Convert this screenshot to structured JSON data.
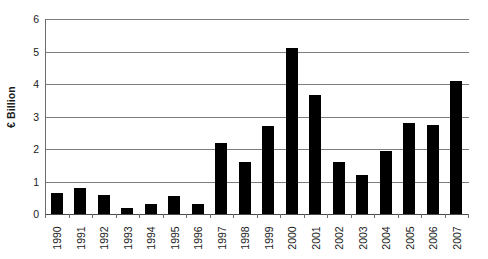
{
  "chart_data": {
    "type": "bar",
    "title": "",
    "xlabel": "",
    "ylabel": "€ Billion",
    "categories": [
      "1990",
      "1991",
      "1992",
      "1993",
      "1994",
      "1995",
      "1996",
      "1997",
      "1998",
      "1999",
      "2000",
      "2001",
      "2002",
      "2003",
      "2004",
      "2005",
      "2006",
      "2007"
    ],
    "values": [
      0.65,
      0.8,
      0.6,
      0.2,
      0.3,
      0.55,
      0.3,
      2.2,
      1.6,
      2.7,
      5.1,
      3.65,
      1.6,
      1.2,
      1.95,
      2.8,
      2.75,
      4.1
    ],
    "ylim": [
      0,
      6
    ],
    "ytick_labels": [
      "0",
      "1",
      "2",
      "3",
      "4",
      "5",
      "6"
    ],
    "ytick_values": [
      0,
      1,
      2,
      3,
      4,
      5,
      6
    ],
    "grid": true,
    "legend": false,
    "legend_position": "none",
    "bar_color": "#000000",
    "gridline_color": "#7d7d7d",
    "axis_color": "#6b6b6b",
    "background_color": "#ffffff",
    "text_color": "#1a1a1a"
  }
}
